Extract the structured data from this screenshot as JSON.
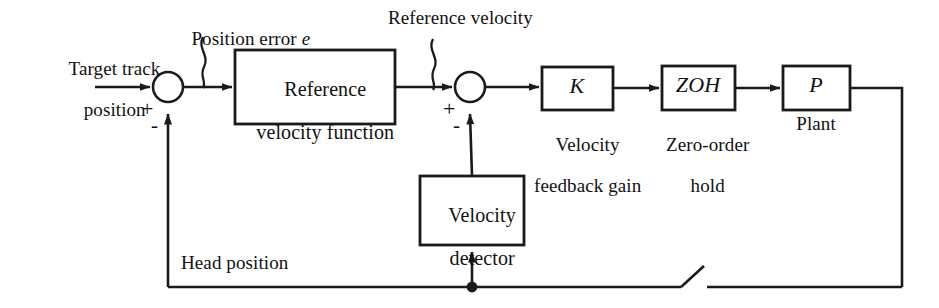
{
  "diagram": {
    "type": "control-block-diagram",
    "stroke_color": "#1a1a1a",
    "background_color": "#ffffff",
    "blocks": [
      {
        "id": "reference-velocity-function",
        "label_line1": "Reference",
        "label_line2": "velocity function",
        "x": 235,
        "y": 50,
        "w": 160,
        "h": 74
      },
      {
        "id": "velocity-feedback-gain",
        "label": "K",
        "caption_line1": "Velocity",
        "caption_line2": "feedback gain",
        "x": 542,
        "y": 67,
        "w": 71,
        "h": 43
      },
      {
        "id": "zero-order-hold",
        "label": "ZOH",
        "caption_line1": "Zero-order",
        "caption_line2": "hold",
        "x": 662,
        "y": 66,
        "w": 73,
        "h": 44
      },
      {
        "id": "plant",
        "label": "P",
        "caption_line1": "Plant",
        "x": 783,
        "y": 66,
        "w": 67,
        "h": 44
      },
      {
        "id": "velocity-detector",
        "label_line1": "Velocity",
        "label_line2": "detector",
        "x": 420,
        "y": 176,
        "w": 104,
        "h": 69
      }
    ],
    "summing_junctions": [
      {
        "id": "position-error-sum",
        "cx": 168,
        "cy": 87,
        "r": 15,
        "plus_sign": "+",
        "minus_sign": "-"
      },
      {
        "id": "velocity-error-sum",
        "cx": 470,
        "cy": 87,
        "r": 15,
        "plus_sign": "+",
        "minus_sign": "-"
      }
    ],
    "signal_labels": [
      {
        "id": "target-track-position",
        "line1": "Target track",
        "line2": "position"
      },
      {
        "id": "position-error",
        "text": "Position error ",
        "italic_symbol": "e"
      },
      {
        "id": "reference-velocity",
        "text": "Reference velocity"
      },
      {
        "id": "head-position",
        "text": "Head position"
      }
    ],
    "switch": {
      "id": "sampler-switch",
      "label": ""
    }
  }
}
